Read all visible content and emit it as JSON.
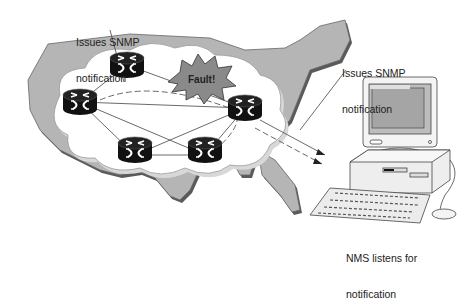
{
  "diagram": {
    "labels": {
      "top_left_callout_line1": "Issues SNMP",
      "top_left_callout_line2": "notification",
      "right_callout_line1": "Issues SNMP",
      "right_callout_line2": "notification",
      "nms_callout_line1": "NMS listens for",
      "nms_callout_line2": "notification",
      "fault_burst": "Fault!"
    },
    "nodes": [
      {
        "id": "router-top",
        "type": "router"
      },
      {
        "id": "router-left",
        "type": "router"
      },
      {
        "id": "router-right",
        "type": "router"
      },
      {
        "id": "router-bottom-left",
        "type": "router"
      },
      {
        "id": "router-bottom-right",
        "type": "router"
      },
      {
        "id": "nms-workstation",
        "type": "computer"
      }
    ],
    "colors": {
      "map_fill": "#b5b5b5",
      "map_shadow": "#5a5a5a",
      "cloud_fill": "#ffffff",
      "router_fill": "#111111",
      "fault_fill": "#8a8a8a"
    }
  }
}
